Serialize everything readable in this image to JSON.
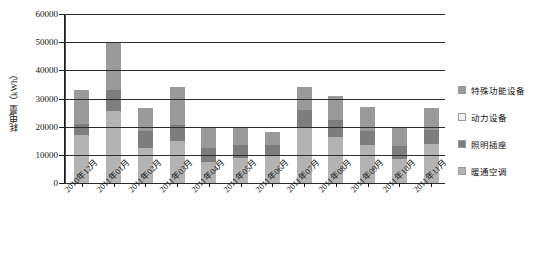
{
  "chart_data": {
    "type": "bar",
    "stacked": true,
    "title": "",
    "xlabel": "",
    "ylabel": "耗电量（kWh）",
    "ylim": [
      0,
      60000
    ],
    "ytick_labels": [
      "0",
      "10000",
      "20000",
      "30000",
      "40000",
      "50000",
      "60000"
    ],
    "ytick_values": [
      0,
      10000,
      20000,
      30000,
      40000,
      50000,
      60000
    ],
    "grid": true,
    "legend_position": "right",
    "categories": [
      "2010年12月",
      "2011年01月",
      "2011年02月",
      "2011年03月",
      "2011年04月",
      "2011年05月",
      "2011年06月",
      "2011年07月",
      "2011年08月",
      "2011年09月",
      "2011年10月",
      "2011年11月"
    ],
    "series": [
      {
        "name": "暖通空调",
        "color": "#b3b3b3",
        "values": [
          17000,
          25500,
          12500,
          15000,
          7500,
          9000,
          10000,
          19500,
          16500,
          13500,
          8500,
          14000
        ]
      },
      {
        "name": "照明插座",
        "color": "#7d7d7d",
        "values": [
          4000,
          7500,
          6000,
          5500,
          5000,
          4500,
          3500,
          6500,
          6000,
          5000,
          4500,
          5000
        ]
      },
      {
        "name": "动力设备",
        "color": "#f2f2f2",
        "values": [
          0,
          0,
          0,
          0,
          0,
          0,
          0,
          0,
          0,
          0,
          0,
          0
        ]
      },
      {
        "name": "特殊功能设备",
        "color": "#9a9a9a",
        "values": [
          12000,
          17000,
          8000,
          13500,
          7500,
          6500,
          4500,
          8000,
          8500,
          8500,
          7000,
          7500
        ]
      }
    ],
    "totals": [
      33000,
      50000,
      26500,
      34000,
      20000,
      20000,
      18000,
      34000,
      31000,
      27000,
      20000,
      26500
    ]
  },
  "legend": {
    "items": [
      {
        "label": "特殊功能设备",
        "color": "#9a9a9a"
      },
      {
        "label": "动力设备",
        "color": "#f2f2f2"
      },
      {
        "label": "照明插座",
        "color": "#7d7d7d"
      },
      {
        "label": "暖通空调",
        "color": "#b3b3b3"
      }
    ]
  }
}
